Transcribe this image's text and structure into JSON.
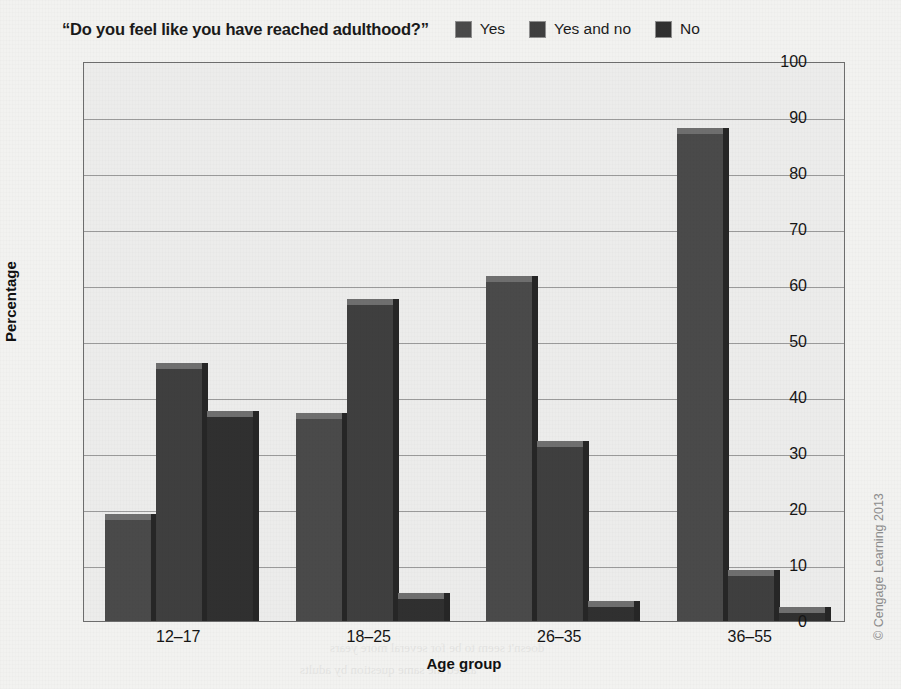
{
  "chart_data": {
    "type": "bar",
    "title": "“Do you feel like you have reached adulthood?”",
    "xlabel": "Age group",
    "ylabel": "Percentage",
    "categories": [
      "12–17",
      "18–25",
      "26–35",
      "36–55"
    ],
    "series": [
      {
        "name": "Yes",
        "values": [
          18,
          36,
          60.5,
          87
        ],
        "color": "#4a4a4a"
      },
      {
        "name": "Yes and no",
        "values": [
          45,
          56.5,
          31,
          8
        ],
        "color": "#3f3f3f"
      },
      {
        "name": "No",
        "values": [
          36.5,
          4,
          2.5,
          1.5
        ],
        "color": "#303030"
      }
    ],
    "ylim": [
      0,
      100
    ],
    "yticks": [
      0,
      10,
      20,
      30,
      40,
      50,
      60,
      70,
      80,
      90,
      100
    ],
    "grid": true,
    "legend_position": "top-right",
    "bar_style": "3d"
  },
  "legend": {
    "items": [
      {
        "label": "Yes"
      },
      {
        "label": "Yes and no"
      },
      {
        "label": "No"
      }
    ]
  },
  "credit": {
    "text": "© Cengage Learning 2013"
  },
  "bleed_through": [
    {
      "text": "Female",
      "x": 430,
      "y": 72,
      "size": 15,
      "bold": true
    },
    {
      "text": "Percent of population",
      "x": 300,
      "y": 96,
      "size": 13,
      "bold": false
    },
    {
      "text": "in the United States",
      "x": 330,
      "y": 120,
      "size": 13,
      "bold": false
    },
    {
      "text": "Identify illness",
      "x": 180,
      "y": 232,
      "size": 12,
      "bold": false
    },
    {
      "text": "Seek or change to others",
      "x": 430,
      "y": 250,
      "size": 12,
      "bold": false
    },
    {
      "text": "Assess symptoms, potential",
      "x": 430,
      "y": 268,
      "size": 12,
      "bold": false
    },
    {
      "text": "Emerging Adulthood",
      "x": 150,
      "y": 432,
      "size": 21,
      "bold": true
    },
    {
      "text": "1 A New Developmental Stage",
      "x": 160,
      "y": 462,
      "size": 17,
      "bold": true
    },
    {
      "text": "doesn't seem to be for several more years",
      "x": 330,
      "y": 640,
      "size": 13,
      "bold": false
    },
    {
      "text": "asked the same question by adults",
      "x": 300,
      "y": 662,
      "size": 13,
      "bold": false
    }
  ]
}
